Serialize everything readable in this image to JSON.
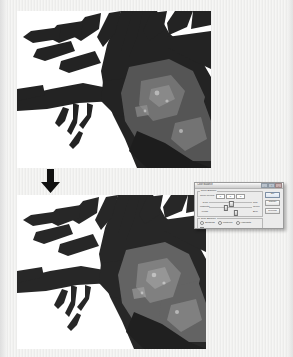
{
  "figure": {
    "panels": [
      {
        "id": "before",
        "caption": "",
        "description": "Black-and-white photograph of a tree trunk with spreading exposed roots and branches"
      },
      {
        "id": "after",
        "caption": "",
        "description": "Same photograph after a Color Balance adjustment, with the Color Balance dialog shown over it"
      }
    ],
    "arrow": {
      "direction": "down",
      "name": "downward-arrow"
    }
  },
  "dialog": {
    "title": "Color Balance",
    "window_controls": [
      {
        "name": "minimize",
        "glyph": "–"
      },
      {
        "name": "maximize",
        "glyph": "□"
      },
      {
        "name": "close",
        "glyph": "×"
      }
    ],
    "color_balance": {
      "legend": "Color Balance",
      "levels_label": "Color Levels:",
      "levels": [
        "0",
        "0",
        "0"
      ],
      "sliders": [
        {
          "left": "Cyan",
          "right": "Red",
          "value": 52
        },
        {
          "left": "Magenta",
          "right": "Green",
          "value": 40
        },
        {
          "left": "Yellow",
          "right": "Blue",
          "value": 63
        }
      ]
    },
    "tone_balance": {
      "legend": "Tone Balance",
      "options": [
        {
          "label": "Shadows",
          "selected": false
        },
        {
          "label": "Midtones",
          "selected": true
        },
        {
          "label": "Highlights",
          "selected": false
        }
      ],
      "preserve_luminosity": {
        "label": "Preserve Luminosity",
        "checked": true,
        "mark": "✓"
      }
    },
    "buttons": [
      {
        "label": "OK",
        "primary": true
      },
      {
        "label": "Cancel",
        "primary": false
      },
      {
        "label": "Preview",
        "primary": false
      }
    ]
  },
  "colors": {
    "page_background": "#f2f2f0",
    "photo_background": "#ffffff",
    "ink": "#1a1a1a",
    "dialog_face": "#ebebeb",
    "dialog_border": "#9a9a9a"
  }
}
